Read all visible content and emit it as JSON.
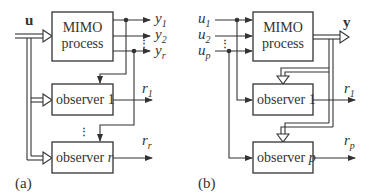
{
  "diagram_a": {
    "caption": "(a)",
    "input_label": "u",
    "process_line1": "MIMO",
    "process_line2": "process",
    "outputs": [
      {
        "base": "y",
        "sub": "1"
      },
      {
        "base": "y",
        "sub": "2"
      },
      {
        "base": "y",
        "sub": "r"
      }
    ],
    "observers": [
      {
        "text": "observer ",
        "idx": "1"
      },
      {
        "text": "observer ",
        "idx": "r"
      }
    ],
    "residuals": [
      {
        "base": "r",
        "sub": "1"
      },
      {
        "base": "r",
        "sub": "r"
      }
    ],
    "ellipsis": "⋮"
  },
  "diagram_b": {
    "caption": "(b)",
    "inputs": [
      {
        "base": "u",
        "sub": "1"
      },
      {
        "base": "u",
        "sub": "2"
      },
      {
        "base": "u",
        "sub": "p"
      }
    ],
    "process_line1": "MIMO",
    "process_line2": "process",
    "output_label": "y",
    "observers": [
      {
        "text": "observer ",
        "idx": "1"
      },
      {
        "text": "observer ",
        "idx": "p"
      }
    ],
    "residuals": [
      {
        "base": "r",
        "sub": "1"
      },
      {
        "base": "r",
        "sub": "p"
      }
    ],
    "ellipsis": "⋮"
  }
}
